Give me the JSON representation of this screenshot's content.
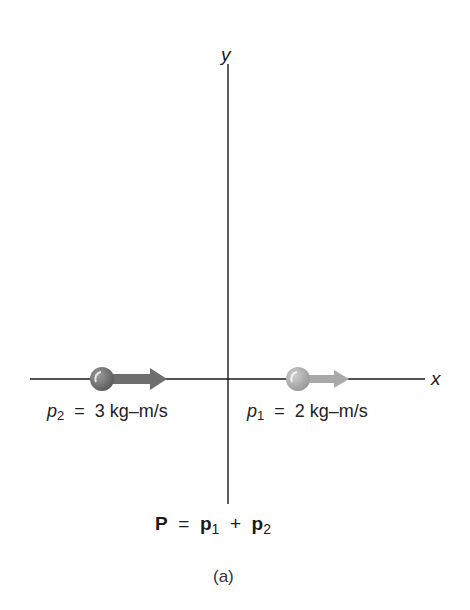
{
  "axes": {
    "x_label": "x",
    "y_label": "y"
  },
  "particles": [
    {
      "name": "p2",
      "symbol": "p",
      "subscript": "2",
      "equals": "=",
      "value": "3 kg–m/s",
      "color": "#6e6e6e",
      "direction": "+x"
    },
    {
      "name": "p1",
      "symbol": "p",
      "subscript": "1",
      "equals": "=",
      "value": "2 kg–m/s",
      "color": "#a9a9a9",
      "direction": "+x"
    }
  ],
  "equation": {
    "lhs": "P",
    "equals": "=",
    "term1": "p",
    "term1_sub": "1",
    "plus": "+",
    "term2": "p",
    "term2_sub": "2"
  },
  "caption": "(a)"
}
